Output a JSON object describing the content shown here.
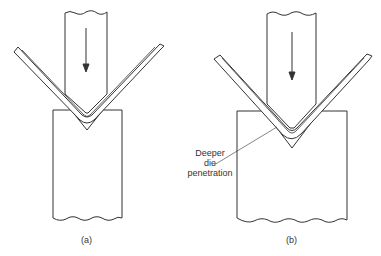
{
  "figure": {
    "panels": [
      {
        "id": "a",
        "caption": "(a)",
        "description": "Punch pressing sheet into V-die with normal die penetration"
      },
      {
        "id": "b",
        "caption": "(b)",
        "description": "Punch pressing sheet into V-die with deeper die penetration"
      }
    ],
    "annotation": {
      "line1": "Deeper",
      "line2": "die",
      "line3": "penetration"
    },
    "colors": {
      "stroke": "#333333",
      "background": "#ffffff"
    }
  }
}
